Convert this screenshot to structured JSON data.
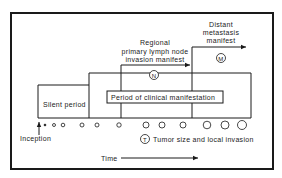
{
  "diagram": {
    "labels": {
      "silent_period": "Silent period",
      "clinical_period": "Period of clinical manifestation",
      "inception": "Inception",
      "time": "Time",
      "regional_line1": "Regional",
      "regional_line2": "primary lymph  node",
      "regional_line3": "invasion  manifest",
      "distant_line1": "Distant",
      "distant_line2": "metastasis",
      "distant_line3": "manifest",
      "tumor_caption": "Tumor  size  and  local  invasion"
    },
    "markers": {
      "n": "N",
      "m": "M",
      "t": "T"
    },
    "colors": {
      "ink": "#1a1a1a",
      "background": "#ffffff"
    }
  }
}
